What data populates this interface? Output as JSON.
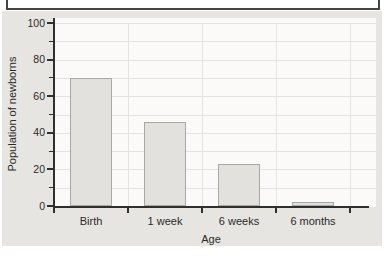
{
  "chart_data": {
    "type": "bar",
    "categories": [
      "Birth",
      "1 week",
      "6 weeks",
      "6 months"
    ],
    "values": [
      70,
      46,
      23,
      2
    ],
    "title": "",
    "xlabel": "Age",
    "ylabel": "Population of newborns",
    "ylim": [
      0,
      100
    ],
    "ytick_major": [
      0,
      20,
      40,
      60,
      80,
      100
    ],
    "ytick_minor": [
      10,
      30,
      50,
      70,
      90
    ],
    "grid": true,
    "legend": false,
    "colors": {
      "panel_bg": "#e7e5e1",
      "plot_bg": "#fbfaf8",
      "gridline": "#e3e3e0",
      "axis": "#2f2f2d",
      "bar_fill": "#e2e1dd",
      "bar_border": "#a9a8a5",
      "text": "#2a2a28"
    }
  }
}
